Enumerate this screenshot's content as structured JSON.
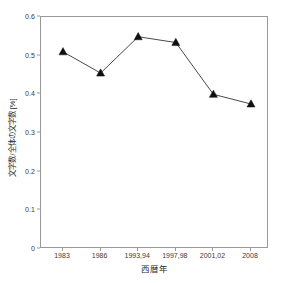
{
  "chart_data": {
    "type": "line",
    "title": "",
    "xlabel": "西暦年",
    "ylabel": "文字数/全体の文字数 [%]",
    "categories": [
      "1983",
      "1986",
      "1993,94",
      "1997,98",
      "2001,02",
      "2008"
    ],
    "values": [
      0.51,
      0.455,
      0.549,
      0.534,
      0.4,
      0.375
    ],
    "series": [
      {
        "name": "文字数/全体の文字数",
        "values": [
          0.51,
          0.455,
          0.549,
          0.534,
          0.4,
          0.375
        ]
      }
    ],
    "ylim": [
      0,
      0.6
    ],
    "y_ticks": [
      "0",
      "0.1",
      "0.2",
      "0.3",
      "0.4",
      "0.5",
      "0.6"
    ],
    "y_tick_values": [
      0,
      0.1,
      0.2,
      0.3,
      0.4,
      0.5,
      0.6
    ],
    "x_ticks": [
      "1983",
      "1986",
      "1993,94",
      "1997,98",
      "2001,02",
      "2008"
    ],
    "grid": false,
    "legend": "none",
    "marker": "triangle",
    "line_color": "#1a1a1a",
    "marker_color": "#111111",
    "frame_color": "#9a9a9a",
    "background": "#ffffff"
  }
}
